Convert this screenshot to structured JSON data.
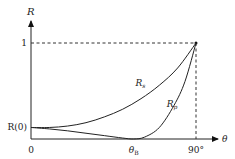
{
  "chart_data": {
    "type": "line",
    "title": "",
    "xlabel": "θ",
    "ylabel": "R",
    "x_ticks": [
      {
        "label": "0",
        "value": 0
      },
      {
        "label": "θ",
        "sub": "B",
        "value": 56
      },
      {
        "label": "90°",
        "value": 90
      }
    ],
    "y_ticks": [
      {
        "label": "1",
        "value": 1
      },
      {
        "label": "R(0)",
        "value": 0.12
      }
    ],
    "xlim": [
      0,
      90
    ],
    "ylim": [
      0,
      1
    ],
    "series": [
      {
        "name": "R",
        "sub": "s",
        "points": [
          [
            0,
            0.12
          ],
          [
            10,
            0.12
          ],
          [
            20,
            0.135
          ],
          [
            30,
            0.17
          ],
          [
            40,
            0.23
          ],
          [
            50,
            0.31
          ],
          [
            60,
            0.42
          ],
          [
            70,
            0.56
          ],
          [
            80,
            0.74
          ],
          [
            90,
            1.0
          ]
        ]
      },
      {
        "name": "R",
        "sub": "p",
        "points": [
          [
            0,
            0.12
          ],
          [
            10,
            0.105
          ],
          [
            20,
            0.085
          ],
          [
            30,
            0.06
          ],
          [
            40,
            0.035
          ],
          [
            50,
            0.01
          ],
          [
            56,
            0.0
          ],
          [
            62,
            0.02
          ],
          [
            70,
            0.12
          ],
          [
            78,
            0.35
          ],
          [
            84,
            0.6
          ],
          [
            90,
            1.0
          ]
        ]
      }
    ],
    "guides": {
      "dashed_to_point": [
        90,
        1
      ]
    }
  }
}
